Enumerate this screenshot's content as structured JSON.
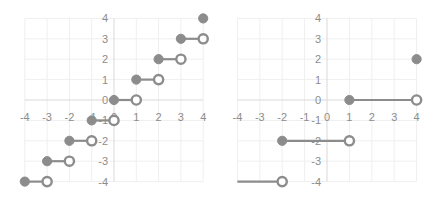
{
  "chart_data": [
    {
      "type": "scatter",
      "title": "",
      "xlabel": "",
      "ylabel": "",
      "xlim": [
        -4,
        4
      ],
      "ylim": [
        -4,
        4
      ],
      "grid": true,
      "legend": "none",
      "x_ticks": [
        "-4",
        "-3",
        "-2",
        "-1",
        "0",
        "1",
        "2",
        "3",
        "4"
      ],
      "y_ticks": [
        "4",
        "3",
        "2",
        "1",
        "0",
        "-1",
        "-2",
        "-3",
        "-4"
      ],
      "segments": [
        {
          "x0": -4,
          "x1": -3,
          "y": -4,
          "start": "filled",
          "end": "hollow"
        },
        {
          "x0": -3,
          "x1": -2,
          "y": -3,
          "start": "filled",
          "end": "hollow"
        },
        {
          "x0": -2,
          "x1": -1,
          "y": -2,
          "start": "filled",
          "end": "hollow"
        },
        {
          "x0": -1,
          "x1": 0,
          "y": -1,
          "start": "filled",
          "end": "hollow"
        },
        {
          "x0": 0,
          "x1": 1,
          "y": 0,
          "start": "filled",
          "end": "hollow"
        },
        {
          "x0": 1,
          "x1": 2,
          "y": 1,
          "start": "filled",
          "end": "hollow"
        },
        {
          "x0": 2,
          "x1": 3,
          "y": 2,
          "start": "filled",
          "end": "hollow"
        },
        {
          "x0": 3,
          "x1": 4,
          "y": 3,
          "start": "filled",
          "end": "hollow"
        }
      ],
      "points": [
        {
          "x": 4,
          "y": 4,
          "marker": "filled"
        }
      ],
      "description": "Step function y = floor(x)"
    },
    {
      "type": "scatter",
      "title": "",
      "xlabel": "",
      "ylabel": "",
      "xlim": [
        -4,
        4
      ],
      "ylim": [
        -4,
        4
      ],
      "grid": true,
      "legend": "none",
      "x_ticks": [
        "-4",
        "-3",
        "-2",
        "-1",
        "0",
        "1",
        "2",
        "3",
        "4"
      ],
      "y_ticks": [
        "4",
        "3",
        "2",
        "1",
        "0",
        "-1",
        "-2",
        "-3",
        "-4"
      ],
      "segments": [
        {
          "x0": -4,
          "x1": -2,
          "y": -4,
          "start": "none",
          "end": "hollow"
        },
        {
          "x0": -2,
          "x1": 1,
          "y": -2,
          "start": "filled",
          "end": "hollow"
        },
        {
          "x0": 1,
          "x1": 4,
          "y": 0,
          "start": "filled",
          "end": "hollow"
        }
      ],
      "points": [
        {
          "x": 4,
          "y": 2,
          "marker": "filled"
        }
      ],
      "description": "Step function with width 3 and step height 2"
    }
  ],
  "colors": {
    "marker": "#8c8c8c",
    "grid": "#efefef",
    "axis": "#d9d9d9",
    "tick_label": "#8c8c8c"
  }
}
